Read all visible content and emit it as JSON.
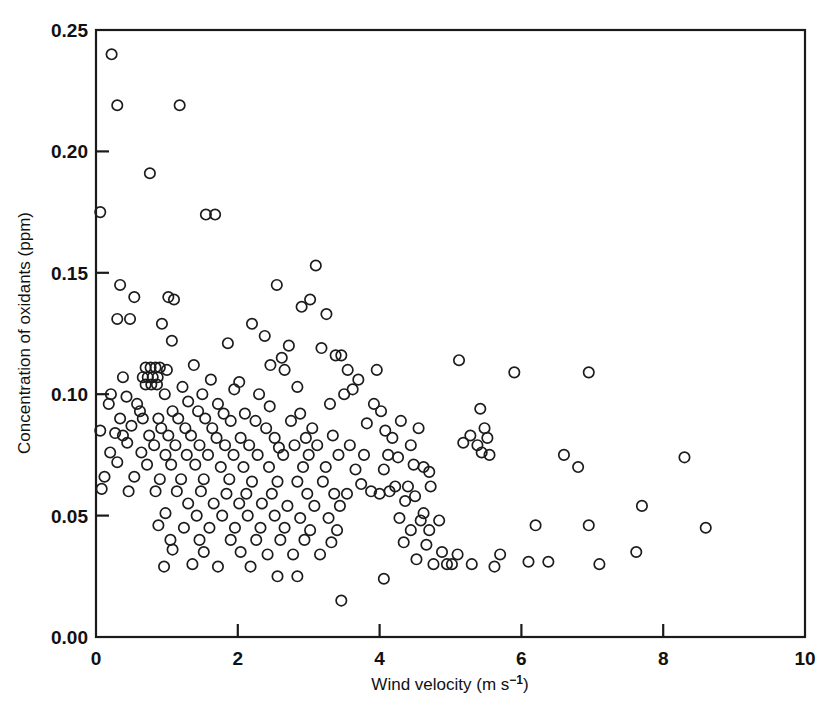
{
  "chart_data": {
    "type": "scatter",
    "title": "",
    "xlabel": "Wind velocity (m s⁻¹)",
    "ylabel": "Concentration of oxidants (ppm)",
    "xlabel_parts": {
      "base": "Wind velocity (m s",
      "exponent": "−1",
      "tail": ")"
    },
    "xlim": [
      0,
      10
    ],
    "ylim": [
      0.0,
      0.25
    ],
    "xticks": [
      0,
      2,
      4,
      6,
      8,
      10
    ],
    "xticklabels": [
      "0",
      "2",
      "4",
      "6",
      "8",
      "10"
    ],
    "yticks": [
      0.0,
      0.05,
      0.1,
      0.15,
      0.2,
      0.25
    ],
    "yticklabels": [
      "0.00",
      "0.05",
      "0.10",
      "0.15",
      "0.20",
      "0.25"
    ],
    "grid": false,
    "legend": null,
    "marker": "open-circle",
    "marker_color": "#1c1c1c",
    "n_points": 241,
    "points": [
      [
        0.22,
        0.24
      ],
      [
        0.3,
        0.219
      ],
      [
        1.18,
        0.219
      ],
      [
        0.76,
        0.191
      ],
      [
        0.06,
        0.175
      ],
      [
        1.55,
        0.174
      ],
      [
        1.68,
        0.174
      ],
      [
        3.1,
        0.153
      ],
      [
        2.55,
        0.145
      ],
      [
        0.34,
        0.145
      ],
      [
        3.02,
        0.139
      ],
      [
        0.54,
        0.14
      ],
      [
        1.02,
        0.14
      ],
      [
        1.1,
        0.139
      ],
      [
        2.9,
        0.136
      ],
      [
        0.3,
        0.131
      ],
      [
        0.48,
        0.131
      ],
      [
        3.25,
        0.133
      ],
      [
        0.93,
        0.129
      ],
      [
        2.2,
        0.129
      ],
      [
        2.38,
        0.124
      ],
      [
        1.07,
        0.122
      ],
      [
        1.86,
        0.121
      ],
      [
        2.72,
        0.12
      ],
      [
        3.18,
        0.119
      ],
      [
        3.38,
        0.116
      ],
      [
        3.46,
        0.116
      ],
      [
        2.62,
        0.115
      ],
      [
        5.12,
        0.114
      ],
      [
        1.38,
        0.112
      ],
      [
        0.7,
        0.111
      ],
      [
        0.77,
        0.111
      ],
      [
        0.84,
        0.111
      ],
      [
        0.9,
        0.111
      ],
      [
        2.66,
        0.11
      ],
      [
        3.55,
        0.11
      ],
      [
        5.9,
        0.109
      ],
      [
        6.95,
        0.109
      ],
      [
        0.66,
        0.107
      ],
      [
        0.73,
        0.107
      ],
      [
        0.8,
        0.107
      ],
      [
        0.87,
        0.107
      ],
      [
        1.62,
        0.106
      ],
      [
        2.02,
        0.105
      ],
      [
        3.7,
        0.106
      ],
      [
        0.7,
        0.104
      ],
      [
        0.78,
        0.104
      ],
      [
        0.86,
        0.104
      ],
      [
        1.22,
        0.103
      ],
      [
        1.95,
        0.102
      ],
      [
        3.62,
        0.102
      ],
      [
        0.21,
        0.1
      ],
      [
        0.43,
        0.099
      ],
      [
        0.97,
        0.1
      ],
      [
        1.5,
        0.1
      ],
      [
        2.3,
        0.1
      ],
      [
        3.5,
        0.1
      ],
      [
        0.18,
        0.096
      ],
      [
        0.58,
        0.096
      ],
      [
        1.3,
        0.097
      ],
      [
        1.72,
        0.096
      ],
      [
        2.45,
        0.095
      ],
      [
        3.3,
        0.096
      ],
      [
        3.92,
        0.096
      ],
      [
        0.62,
        0.093
      ],
      [
        1.08,
        0.093
      ],
      [
        1.44,
        0.093
      ],
      [
        1.8,
        0.092
      ],
      [
        2.1,
        0.092
      ],
      [
        2.88,
        0.092
      ],
      [
        4.02,
        0.093
      ],
      [
        5.42,
        0.094
      ],
      [
        0.34,
        0.09
      ],
      [
        0.88,
        0.09
      ],
      [
        1.16,
        0.09
      ],
      [
        1.54,
        0.09
      ],
      [
        1.9,
        0.089
      ],
      [
        2.25,
        0.089
      ],
      [
        2.75,
        0.089
      ],
      [
        4.3,
        0.089
      ],
      [
        0.5,
        0.087
      ],
      [
        0.92,
        0.086
      ],
      [
        1.26,
        0.086
      ],
      [
        1.64,
        0.086
      ],
      [
        2.4,
        0.086
      ],
      [
        3.05,
        0.086
      ],
      [
        4.55,
        0.086
      ],
      [
        5.48,
        0.086
      ],
      [
        0.06,
        0.085
      ],
      [
        0.27,
        0.084
      ],
      [
        0.75,
        0.083
      ],
      [
        1.02,
        0.083
      ],
      [
        1.34,
        0.083
      ],
      [
        1.7,
        0.082
      ],
      [
        2.04,
        0.082
      ],
      [
        2.52,
        0.082
      ],
      [
        2.96,
        0.082
      ],
      [
        3.34,
        0.083
      ],
      [
        4.18,
        0.082
      ],
      [
        5.28,
        0.083
      ],
      [
        5.52,
        0.082
      ],
      [
        0.44,
        0.08
      ],
      [
        0.82,
        0.079
      ],
      [
        1.12,
        0.079
      ],
      [
        1.46,
        0.079
      ],
      [
        1.82,
        0.079
      ],
      [
        2.16,
        0.079
      ],
      [
        2.58,
        0.078
      ],
      [
        2.8,
        0.079
      ],
      [
        3.12,
        0.079
      ],
      [
        3.58,
        0.079
      ],
      [
        4.44,
        0.079
      ],
      [
        5.18,
        0.08
      ],
      [
        5.38,
        0.079
      ],
      [
        6.6,
        0.075
      ],
      [
        8.3,
        0.074
      ],
      [
        0.2,
        0.076
      ],
      [
        0.64,
        0.076
      ],
      [
        0.98,
        0.075
      ],
      [
        1.28,
        0.075
      ],
      [
        1.58,
        0.075
      ],
      [
        1.94,
        0.075
      ],
      [
        2.28,
        0.075
      ],
      [
        2.64,
        0.075
      ],
      [
        3.0,
        0.075
      ],
      [
        3.42,
        0.075
      ],
      [
        3.78,
        0.075
      ],
      [
        4.12,
        0.075
      ],
      [
        5.55,
        0.075
      ],
      [
        0.3,
        0.072
      ],
      [
        0.72,
        0.071
      ],
      [
        1.06,
        0.071
      ],
      [
        1.4,
        0.071
      ],
      [
        1.76,
        0.07
      ],
      [
        2.08,
        0.07
      ],
      [
        2.44,
        0.07
      ],
      [
        2.92,
        0.07
      ],
      [
        3.24,
        0.07
      ],
      [
        3.66,
        0.069
      ],
      [
        4.06,
        0.069
      ],
      [
        4.62,
        0.07
      ],
      [
        6.8,
        0.07
      ],
      [
        0.12,
        0.066
      ],
      [
        0.54,
        0.066
      ],
      [
        0.9,
        0.065
      ],
      [
        1.2,
        0.065
      ],
      [
        1.52,
        0.065
      ],
      [
        1.88,
        0.065
      ],
      [
        2.2,
        0.064
      ],
      [
        2.56,
        0.064
      ],
      [
        2.84,
        0.064
      ],
      [
        3.2,
        0.064
      ],
      [
        3.74,
        0.063
      ],
      [
        4.22,
        0.062
      ],
      [
        4.4,
        0.062
      ],
      [
        4.72,
        0.062
      ],
      [
        0.08,
        0.061
      ],
      [
        0.46,
        0.06
      ],
      [
        0.84,
        0.06
      ],
      [
        1.14,
        0.06
      ],
      [
        1.48,
        0.06
      ],
      [
        1.84,
        0.059
      ],
      [
        2.12,
        0.059
      ],
      [
        2.48,
        0.059
      ],
      [
        2.98,
        0.059
      ],
      [
        3.36,
        0.059
      ],
      [
        3.54,
        0.059
      ],
      [
        4.0,
        0.059
      ],
      [
        4.5,
        0.058
      ],
      [
        1.3,
        0.055
      ],
      [
        1.66,
        0.055
      ],
      [
        2.02,
        0.055
      ],
      [
        2.34,
        0.055
      ],
      [
        2.7,
        0.054
      ],
      [
        3.08,
        0.054
      ],
      [
        3.44,
        0.054
      ],
      [
        7.7,
        0.054
      ],
      [
        0.98,
        0.051
      ],
      [
        1.42,
        0.05
      ],
      [
        1.78,
        0.05
      ],
      [
        2.14,
        0.05
      ],
      [
        2.52,
        0.05
      ],
      [
        2.88,
        0.049
      ],
      [
        3.28,
        0.049
      ],
      [
        4.28,
        0.049
      ],
      [
        4.58,
        0.048
      ],
      [
        4.84,
        0.048
      ],
      [
        8.6,
        0.045
      ],
      [
        0.88,
        0.046
      ],
      [
        1.24,
        0.045
      ],
      [
        1.6,
        0.045
      ],
      [
        1.96,
        0.045
      ],
      [
        2.32,
        0.045
      ],
      [
        2.66,
        0.045
      ],
      [
        3.02,
        0.044
      ],
      [
        3.4,
        0.044
      ],
      [
        4.44,
        0.044
      ],
      [
        4.7,
        0.044
      ],
      [
        6.2,
        0.046
      ],
      [
        6.95,
        0.046
      ],
      [
        1.05,
        0.04
      ],
      [
        1.46,
        0.04
      ],
      [
        1.9,
        0.04
      ],
      [
        2.26,
        0.04
      ],
      [
        2.6,
        0.04
      ],
      [
        2.94,
        0.04
      ],
      [
        3.32,
        0.039
      ],
      [
        4.34,
        0.039
      ],
      [
        4.66,
        0.038
      ],
      [
        4.88,
        0.035
      ],
      [
        5.1,
        0.034
      ],
      [
        5.7,
        0.034
      ],
      [
        6.1,
        0.031
      ],
      [
        6.38,
        0.031
      ],
      [
        7.1,
        0.03
      ],
      [
        7.62,
        0.035
      ],
      [
        1.08,
        0.036
      ],
      [
        1.52,
        0.035
      ],
      [
        2.04,
        0.035
      ],
      [
        2.42,
        0.034
      ],
      [
        2.78,
        0.034
      ],
      [
        3.16,
        0.034
      ],
      [
        4.52,
        0.032
      ],
      [
        4.76,
        0.03
      ],
      [
        4.95,
        0.03
      ],
      [
        5.02,
        0.03
      ],
      [
        5.3,
        0.03
      ],
      [
        5.62,
        0.029
      ],
      [
        2.56,
        0.025
      ],
      [
        2.84,
        0.025
      ],
      [
        4.06,
        0.024
      ],
      [
        3.46,
        0.015
      ],
      [
        1.36,
        0.03
      ],
      [
        1.72,
        0.029
      ],
      [
        2.18,
        0.029
      ],
      [
        0.96,
        0.029
      ],
      [
        3.88,
        0.06
      ],
      [
        4.14,
        0.06
      ],
      [
        4.36,
        0.056
      ],
      [
        4.62,
        0.051
      ],
      [
        0.38,
        0.107
      ],
      [
        0.38,
        0.083
      ],
      [
        0.66,
        0.09
      ],
      [
        1.0,
        0.11
      ],
      [
        2.46,
        0.112
      ],
      [
        2.84,
        0.103
      ],
      [
        3.82,
        0.088
      ],
      [
        4.08,
        0.085
      ],
      [
        4.26,
        0.074
      ],
      [
        4.48,
        0.071
      ],
      [
        4.7,
        0.068
      ],
      [
        5.44,
        0.076
      ],
      [
        3.96,
        0.11
      ]
    ]
  }
}
